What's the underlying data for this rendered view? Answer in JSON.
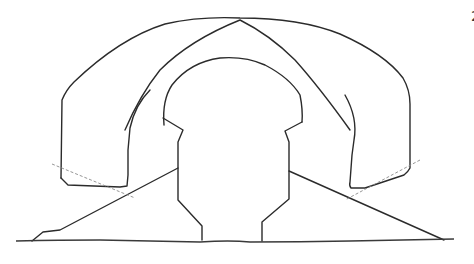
{
  "drawing": {
    "description": "Hand-drawn pencil sketch of nested arches on a base",
    "stroke_color": "#2b2b2b",
    "background_color": "#ffffff",
    "edge_glyph": "2"
  }
}
